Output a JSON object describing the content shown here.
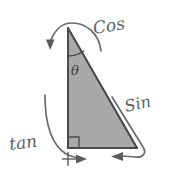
{
  "figure": {
    "background_color": "#ffffff",
    "stroke_color": "#6b6b6b",
    "triangle": {
      "fill_color": "#a9a9a9",
      "edge_color": "#555555",
      "vertices": {
        "apex": [
          68,
          28
        ],
        "bottom_left": [
          68,
          148
        ],
        "bottom_right": [
          137,
          148
        ]
      },
      "right_angle_marker": {
        "corner": "bottom_left",
        "size": 11
      }
    },
    "angle": {
      "symbol": "θ",
      "label": "θ",
      "name": "theta",
      "vertex": "apex",
      "arc_radius": 24,
      "text_position": [
        70,
        70
      ]
    },
    "labels": [
      {
        "id": "cos",
        "text": "Cos",
        "position": [
          96,
          30
        ],
        "rotation": -10,
        "font_size": 17,
        "refers_to": "adjacent-side-vertical"
      },
      {
        "id": "sin",
        "text": "Sin",
        "position": [
          128,
          107
        ],
        "rotation": -14,
        "font_size": 16,
        "refers_to": "hypotenuse"
      },
      {
        "id": "tan",
        "text": "tan",
        "position": [
          10,
          146
        ],
        "rotation": -8,
        "font_size": 17,
        "refers_to": "opposite-side-horizontal"
      }
    ],
    "arrows": [
      {
        "id": "cos-arrow",
        "label_ref": "cos",
        "description": "curved arc over the apex ending in a downward arrowhead to the left of the vertical leg",
        "head_direction": "down",
        "head_position": [
          50,
          45
        ]
      },
      {
        "id": "sin-arrow",
        "label_ref": "sin",
        "description": "line parallel to the hypotenuse curving at the bottom into a leftward arrowhead",
        "head_direction": "left",
        "head_position": [
          117,
          156
        ]
      },
      {
        "id": "tan-arrow",
        "label_ref": "tan",
        "description": "curve sweeping from upper left down to a rightward arrowhead under the base",
        "head_direction": "right",
        "head_position": [
          84,
          159
        ]
      }
    ],
    "tick_mark": {
      "id": "base-start-tick",
      "position": [
        68,
        159
      ],
      "description": "small cross tick marking the start of the base measurement"
    }
  }
}
